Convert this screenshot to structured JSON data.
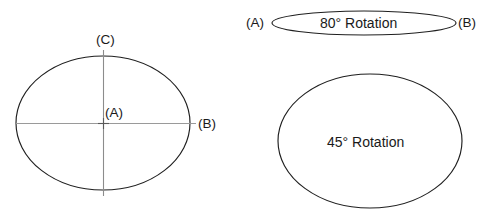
{
  "figure": {
    "background_color": "#ffffff",
    "stroke_color": "#1f1f1f",
    "axis_color": "#9a9a9a",
    "text_color": "#1a1a1a"
  },
  "shapes": {
    "main_ellipse": {
      "name": "reference-ellipse",
      "center_label": "(A)",
      "right_vertex_label": "(B)",
      "top_vertex_label": "(C)",
      "cx": 103,
      "cy": 123,
      "rx": 87,
      "ry": 67,
      "rotation_deg": 0
    },
    "flat_ellipse": {
      "name": "eighty-degree-rotation-ellipse",
      "label": "80° Rotation",
      "left_vertex_label": "(A)",
      "right_vertex_label": "(B)",
      "cx": 364,
      "cy": 23,
      "rx": 92,
      "ry": 12,
      "rotation_deg": 80
    },
    "round_ellipse": {
      "name": "forty-five-degree-rotation-ellipse",
      "label": "45° Rotation",
      "cx": 370,
      "cy": 141,
      "rx": 92,
      "ry": 67,
      "rotation_deg": 45
    }
  },
  "labels": {
    "main_center": "(A)",
    "main_right": "(B)",
    "main_top": "(C)",
    "flat_left": "(A)",
    "flat_right": "(B)",
    "flat_text": "80° Rotation",
    "round_text": "45° Rotation"
  },
  "axes": {
    "horizontal": {
      "x1": 16,
      "y1": 123,
      "x2": 196,
      "y2": 123
    },
    "vertical": {
      "x1": 103,
      "y1": 50,
      "x2": 103,
      "y2": 196
    }
  }
}
